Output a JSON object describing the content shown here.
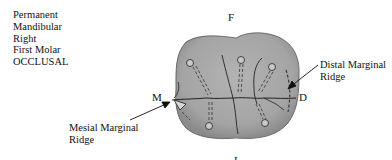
{
  "title_block": {
    "lines": [
      "Permanent",
      "Mandibular",
      "Right",
      "First Molar",
      "OCCLUSAL"
    ]
  },
  "orientation_labels": {
    "facial": "F",
    "mesial": "M",
    "distal": "D",
    "lingual": "L"
  },
  "callouts": {
    "distal_marginal_ridge": {
      "line1": "Distal Marginal",
      "line2": "Ridge"
    },
    "mesial_marginal_ridge": {
      "line1": "Mesial Marginal",
      "line2": "Ridge"
    }
  },
  "colors": {
    "tooth_fill": "#a9a9a9",
    "tooth_shadow": "#8c8c8c",
    "outline": "#222222",
    "text": "#111111"
  }
}
